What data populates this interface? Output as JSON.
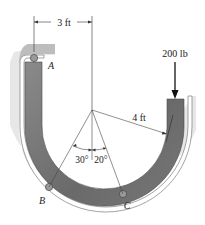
{
  "diagram": {
    "type": "engineering-mechanics-figure",
    "colors": {
      "bar": "#7a7a7a",
      "bar_dark": "#5e5e5e",
      "guide_shadow": "#b5b5b5",
      "guide_inner": "#ffffff",
      "roller": "#9a9a9a",
      "line": "#333333"
    },
    "dimensions": {
      "horizontal": "3 ft",
      "radius": "4 ft"
    },
    "load": {
      "label": "200 lb",
      "direction": "down"
    },
    "angles": {
      "left": "30°",
      "right": "20°"
    },
    "points": {
      "A": "A",
      "B": "B",
      "C": "C"
    }
  }
}
